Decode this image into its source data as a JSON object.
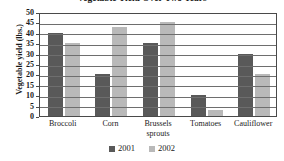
{
  "chart_data": {
    "type": "bar",
    "title": "Vegetable Yield Over Two Years",
    "xlabel": "",
    "ylabel": "Vegetable yield (lbs.)",
    "ylim": [
      0,
      50
    ],
    "ytick_step": 5,
    "ytick_labels": [
      "0",
      "5",
      "10",
      "15",
      "20",
      "25",
      "30",
      "35",
      "40",
      "45",
      "50"
    ],
    "grid": true,
    "legend_position": "bottom",
    "categories": [
      "Broccoli",
      "Corn",
      "Brussels sprouts",
      "Tomatoes",
      "Cauliflower"
    ],
    "category_lines": [
      [
        "Broccoli"
      ],
      [
        "Corn"
      ],
      [
        "Brussels",
        "sprouts"
      ],
      [
        "Tomatoes"
      ],
      [
        "Cauliflower"
      ]
    ],
    "series": [
      {
        "name": "2001",
        "color": "#595959",
        "values": [
          40,
          20,
          35,
          10,
          30
        ]
      },
      {
        "name": "2002",
        "color": "#b9b9b9",
        "values": [
          35,
          43,
          45,
          3,
          20
        ]
      }
    ]
  }
}
